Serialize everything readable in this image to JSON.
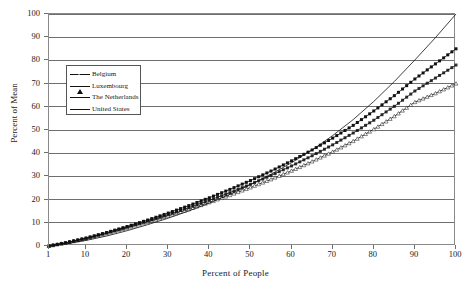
{
  "chart_data": {
    "type": "line",
    "title": "",
    "xlabel": "Percent of People",
    "ylabel": "Percent of Mean",
    "xlim": [
      1,
      100
    ],
    "ylim": [
      0,
      100
    ],
    "grid": true,
    "legend_position": "upper-left-inside",
    "xticks": [
      "1",
      "10",
      "20",
      "30",
      "40",
      "50",
      "60",
      "70",
      "80",
      "90",
      "100"
    ],
    "xtick_values": [
      1,
      10,
      20,
      30,
      40,
      50,
      60,
      70,
      80,
      90,
      100
    ],
    "yticks": [
      "0",
      "10",
      "20",
      "30",
      "40",
      "50",
      "60",
      "70",
      "80",
      "90",
      "100"
    ],
    "ytick_values": [
      0,
      10,
      20,
      30,
      40,
      50,
      60,
      70,
      80,
      90,
      100
    ],
    "x": [
      1,
      5,
      10,
      15,
      20,
      25,
      30,
      35,
      40,
      45,
      50,
      55,
      60,
      65,
      70,
      75,
      80,
      85,
      90,
      95,
      100
    ],
    "series": [
      {
        "name": "Belgium",
        "marker": "triangle-open",
        "color": "#111111",
        "values": [
          0,
          1.3,
          3.2,
          5.4,
          7.8,
          10.3,
          13.0,
          15.8,
          18.8,
          21.9,
          25.2,
          28.7,
          32.4,
          36.4,
          40.6,
          45.2,
          50.3,
          55.9,
          62.0,
          65.8,
          70.0
        ]
      },
      {
        "name": "Luxembourg",
        "marker": "square-filled",
        "color": "#111111",
        "values": [
          0,
          1.4,
          3.4,
          5.8,
          8.4,
          11.2,
          14.2,
          17.4,
          20.8,
          24.4,
          28.2,
          32.3,
          36.7,
          41.4,
          46.5,
          52.0,
          58.2,
          64.8,
          72.0,
          78.5,
          85.0
        ]
      },
      {
        "name": "The Netherlands",
        "marker": "square-dash",
        "color": "#111111",
        "values": [
          0,
          1.3,
          3.3,
          5.6,
          8.1,
          10.7,
          13.5,
          16.5,
          19.7,
          23.0,
          26.6,
          30.4,
          34.5,
          38.9,
          43.6,
          48.7,
          54.2,
          60.2,
          66.8,
          72.4,
          78.0
        ]
      },
      {
        "name": "United States",
        "marker": "none",
        "color": "#111111",
        "values": [
          0,
          0.9,
          2.4,
          4.3,
          6.6,
          9.2,
          12.0,
          15.1,
          18.5,
          22.3,
          26.4,
          30.9,
          35.9,
          41.4,
          47.6,
          54.5,
          62.3,
          70.9,
          80.2,
          89.8,
          100.0
        ]
      }
    ]
  },
  "axes": {
    "x_title": "Percent of People",
    "y_title": "Percent of Mean"
  },
  "legend": {
    "items": [
      {
        "label": "Belgium"
      },
      {
        "label": "Luxembourg"
      },
      {
        "label": "The Netherlands"
      },
      {
        "label": "United States"
      }
    ]
  }
}
